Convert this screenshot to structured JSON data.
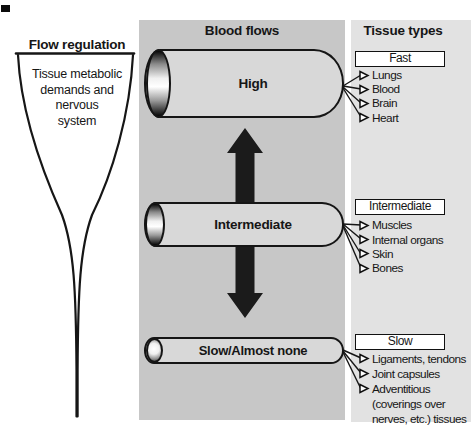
{
  "left": {
    "header": "Flow regulation",
    "funnel_lines": [
      "Tissue metabolic",
      "demands and",
      "nervous",
      "system"
    ]
  },
  "middle": {
    "header": "Blood flows",
    "cylinders": [
      {
        "label": "High"
      },
      {
        "label": "Intermediate"
      },
      {
        "label": "Slow/Almost none"
      }
    ]
  },
  "right": {
    "header": "Tissue types",
    "groups": [
      {
        "box": "Fast",
        "items": [
          "Lungs",
          "Blood",
          "Brain",
          "Heart"
        ]
      },
      {
        "box": "Intermediate",
        "items": [
          "Muscles",
          "Internal organs",
          "Skin",
          "Bones"
        ]
      },
      {
        "box": "Slow",
        "items": [
          "Ligaments, tendons",
          "Joint capsules",
          "Adventitious"
        ],
        "item_continuation": [
          "(coverings over",
          "nerves, etc.) tissues"
        ]
      }
    ]
  },
  "colors": {
    "middle_panel_bg": "#c7c7c7",
    "right_panel_bg": "#e2e2e2",
    "cylinder_fill": "#d8d8d8",
    "box_bg": "#ffffff",
    "ink": "#111111"
  }
}
